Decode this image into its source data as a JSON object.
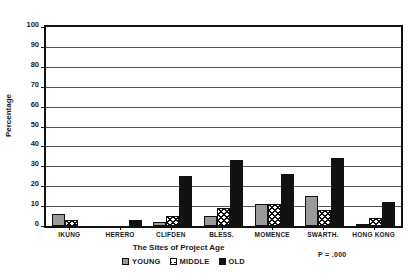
{
  "chart_data": {
    "type": "bar",
    "title": "",
    "xlabel": "The Sites of Project Age",
    "ylabel": "Percentage",
    "ylim": [
      0,
      100
    ],
    "ytick_values": [
      0,
      10,
      20,
      30,
      40,
      50,
      60,
      70,
      80,
      90,
      100
    ],
    "ytick_labels": [
      "0",
      "10",
      "20",
      "30",
      "40",
      "50",
      "60",
      "70",
      "80",
      "90",
      "100"
    ],
    "grid": true,
    "legend_position": "bottom-center",
    "categories": [
      "IKUNG",
      "HERERO",
      "CLIFDEN",
      "BLESS.",
      "MOMENCE",
      "SWARTH.",
      "HONG KONG"
    ],
    "series": [
      {
        "name": "YOUNG",
        "values": [
          6,
          0,
          2,
          5,
          11,
          15,
          1
        ]
      },
      {
        "name": "MIDDLE",
        "values": [
          3,
          0,
          5,
          9,
          11,
          8,
          4
        ]
      },
      {
        "name": "OLD",
        "values": [
          0,
          3,
          25,
          33,
          26,
          34,
          12
        ]
      }
    ],
    "annotation": "P = .000"
  },
  "legend": {
    "entries": [
      {
        "label": "YOUNG"
      },
      {
        "label": "MIDDLE"
      },
      {
        "label": "OLD"
      }
    ]
  },
  "axes": {
    "y_title": "Percentage",
    "x_title": "The Sites of Project Age"
  },
  "footnote": {
    "p_value": "P = .000"
  },
  "colors": {
    "young": "#9a9a9a",
    "middle": "#ffffff",
    "old": "#111111",
    "axis": "#111111",
    "grid": "#555555"
  }
}
